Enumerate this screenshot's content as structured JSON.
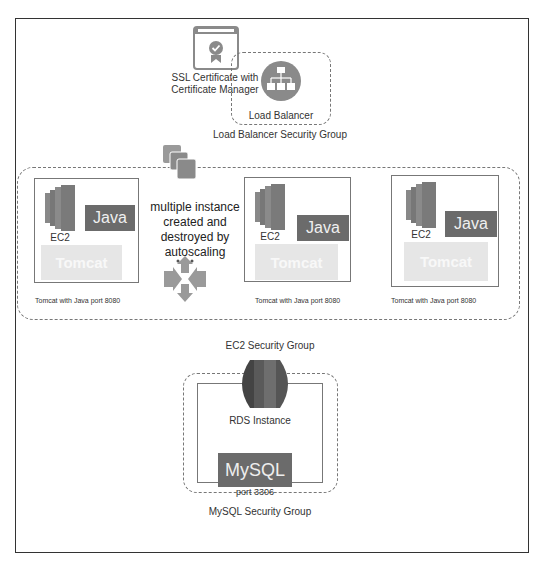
{
  "diagram": {
    "ssl": {
      "label_line1": "SSL Certificate with",
      "label_line2": "Certificate Manager",
      "icon": "certificate-icon"
    },
    "load_balancer": {
      "label": "Load Balancer",
      "group_label": "Load Balancer Security Group",
      "icon": "load-balancer-icon"
    },
    "autoscaling": {
      "line1": "multiple instance",
      "line2": "created and",
      "line3": "destroyed by",
      "line4": "autoscaling",
      "icons": [
        "instances-stack-icon",
        "autoscaling-arrows-icon"
      ]
    },
    "ec2_instances": [
      {
        "ec2_label": "EC2",
        "java_label": "Java",
        "tomcat_label": "Tomcat",
        "caption": "Tomcat with Java port 8080"
      },
      {
        "ec2_label": "EC2",
        "java_label": "Java",
        "tomcat_label": "Tomcat",
        "caption": "Tomcat with Java port 8080"
      },
      {
        "ec2_label": "EC2",
        "java_label": "Java",
        "tomcat_label": "Tomcat",
        "caption": "Tomcat with Java port 8080"
      }
    ],
    "ec2_group_label": "EC2 Security Group",
    "rds": {
      "label": "RDS Instance",
      "mysql_label": "MySQL",
      "port_label": "port 3306",
      "group_label": "MySQL Security Group",
      "icon": "rds-icon"
    },
    "colors": {
      "dark_block": "#6b6b6b",
      "light_block": "#e6e6e6",
      "icon_gray": "#8a8a8a",
      "dash": "#777777"
    }
  }
}
